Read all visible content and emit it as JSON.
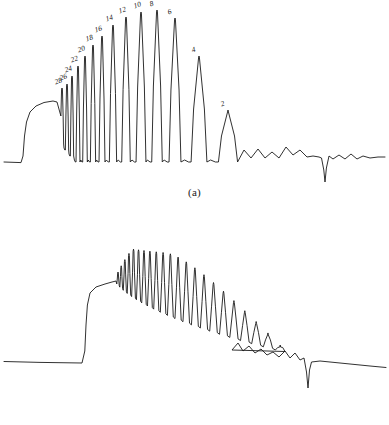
{
  "figure": {
    "background_color": "#ffffff",
    "trace_color": "#1a1a1a",
    "label_color": "#111111"
  },
  "panels": [
    {
      "id": "a",
      "caption": "(a)",
      "peak_labels": [
        "28",
        "26",
        "24",
        "22",
        "20",
        "18",
        "16",
        "14",
        "12",
        "10",
        "8",
        "6",
        "4",
        "2"
      ]
    },
    {
      "id": "b",
      "caption": "(b)",
      "peak_labels": []
    }
  ],
  "chart_data": {
    "type": "line",
    "title": "",
    "xlabel": "",
    "ylabel": "",
    "grid": false,
    "legend": "none",
    "panel_count": 2,
    "series": [
      {
        "name": "panel-a-trace",
        "panel": "a",
        "description": "Flat baseline, sharp step rise to plateau, train of narrow oscillation peaks of rising then falling amplitude returning to a flat baseline, small ripples and one sharp negative spike in the tail",
        "xlim": [
          0,
          389
        ],
        "ylim": [
          190,
          0
        ],
        "baseline_y": 162,
        "step_rise_x": 23,
        "plateau_y": 101,
        "negative_spike_x": 325,
        "negative_spike_depth_y": 182,
        "x": [
          95,
          91,
          87,
          83,
          79,
          75,
          71,
          66,
          61,
          55,
          49,
          42,
          35,
          27
        ],
        "peaks": [
          {
            "label": "28",
            "x": 62,
            "top_y": 88
          },
          {
            "label": "26",
            "x": 67,
            "top_y": 84
          },
          {
            "label": "24",
            "x": 72,
            "top_y": 76
          },
          {
            "label": "22",
            "x": 78,
            "top_y": 66
          },
          {
            "label": "20",
            "x": 85,
            "top_y": 56
          },
          {
            "label": "18",
            "x": 93,
            "top_y": 45
          },
          {
            "label": "16",
            "x": 102,
            "top_y": 36
          },
          {
            "label": "14",
            "x": 113,
            "top_y": 25
          },
          {
            "label": "12",
            "x": 126,
            "top_y": 17
          },
          {
            "label": "10",
            "x": 141,
            "top_y": 12
          },
          {
            "label": "8",
            "x": 157,
            "top_y": 10
          },
          {
            "label": "6",
            "x": 175,
            "top_y": 18
          },
          {
            "label": "4",
            "x": 199,
            "top_y": 56
          },
          {
            "label": "2",
            "x": 228,
            "top_y": 110
          }
        ]
      },
      {
        "name": "panel-b-trace",
        "panel": "b",
        "description": "Flat baseline, steep rise with rounded shoulder, oscillation train whose peaks and troughs both decay along a downward sloping envelope, small ripples and one deep narrow negative spike near the end, then a gently sloping tail",
        "xlim": [
          0,
          389
        ],
        "ylim": [
          188,
          0
        ],
        "baseline_y": 153,
        "step_rise_x": 84,
        "shoulder_y": 72,
        "negative_spike_x": 308,
        "negative_spike_depth_y": 178
      }
    ]
  }
}
